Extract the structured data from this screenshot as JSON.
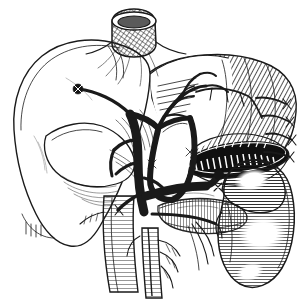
{
  "figure": {
    "title": "Upper abdominal viscera, pen-and-ink anatomical illustration",
    "style": "black-and-white line engraving with cross-hatching",
    "background_color": "#ffffff",
    "ink_color": "#1a1a1a",
    "width_px": 304,
    "height_px": 306
  },
  "structures": {
    "esophagus_stump": {
      "name": "esophageal stump",
      "shading": "cross-hatched cylinder with open elliptical lumen",
      "position": "top center"
    },
    "liver": {
      "name": "liver",
      "lobes": [
        "left lobe",
        "right lobe",
        "caudate lobe",
        "quadrate lobe"
      ],
      "shading": "outline with light stipple at inferior margin",
      "position": "left"
    },
    "stomach": {
      "name": "stomach",
      "detail": "opened along greater curvature showing rugal folds",
      "shading": "dense diagonal hatching on serosal surface",
      "position": "upper right"
    },
    "gastric_rugae": {
      "name": "gastric rugae",
      "detail": "dark open lumen with transverse mucosal folds"
    },
    "ligated_vessels": {
      "name": "ligated short gastric vessels",
      "count": 4,
      "detail": "tied-off stumps along greater curvature"
    },
    "kidney": {
      "name": "right kidney",
      "shading": "curved contour hatching with white highlight",
      "position": "right lower"
    },
    "celiac_trunk": {
      "name": "celiac trunk",
      "rendering": "solid black vessel"
    },
    "hepatic_artery": {
      "name": "hepatic artery stump",
      "rendering": "solid black, clamped/ligated end pointing left"
    },
    "splenic_artery": {
      "name": "splenic artery",
      "rendering": "solid black arcing vessel"
    },
    "portal_vein": {
      "name": "portal vein",
      "rendering": "solid black trunk descending centrally"
    },
    "left_renal_vein": {
      "name": "left renal vein",
      "rendering": "solid black horizontal vessel with ligated end"
    },
    "aorta": {
      "name": "abdominal aorta",
      "shading": "fine horizontal contour hatching",
      "position": "lower center"
    },
    "inferior_vena_cava": {
      "name": "inferior vena cava",
      "shading": "fine contour hatching"
    },
    "superior_mesenteric_artery": {
      "name": "superior mesenteric artery branches",
      "position": "lower center, descending"
    },
    "pancreas": {
      "name": "pancreas",
      "shading": "short parallel lobular strokes",
      "position": "center right below splenic artery"
    }
  }
}
